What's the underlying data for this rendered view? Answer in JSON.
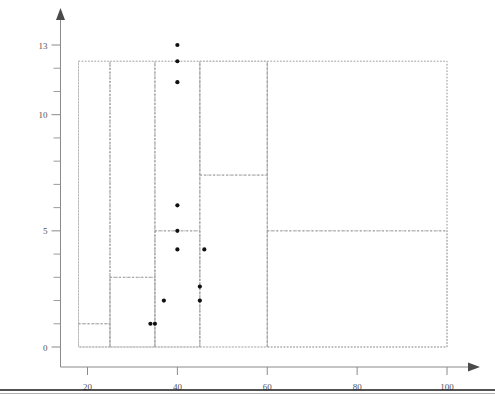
{
  "chart_data": {
    "type": "scatter",
    "title": "",
    "subtitle": "",
    "xlabel": "",
    "ylabel": "",
    "xlim": [
      14,
      104
    ],
    "ylim": [
      0,
      13.6
    ],
    "xticks": [
      20,
      40,
      60,
      80,
      100
    ],
    "xtick_labels": [
      "20",
      "40",
      "60",
      "80",
      "100"
    ],
    "yticks": [
      0,
      5,
      10,
      13
    ],
    "ytick_labels": [
      "0",
      "5",
      "10",
      "13"
    ],
    "y_minor_ticks": [
      1,
      2,
      3,
      4,
      6,
      7,
      8,
      9,
      11,
      12
    ],
    "grid": false,
    "legend": null,
    "legend_position": "none",
    "point_color": "#111111",
    "partition_color": "#b9b9b9",
    "axis_color": "#8a8a8a",
    "points": [
      {
        "x": 40,
        "y": 13
      },
      {
        "x": 40,
        "y": 12.3
      },
      {
        "x": 40,
        "y": 11.4
      },
      {
        "x": 40,
        "y": 6.1
      },
      {
        "x": 40,
        "y": 5
      },
      {
        "x": 40,
        "y": 4.2
      },
      {
        "x": 46,
        "y": 4.2
      },
      {
        "x": 45,
        "y": 2.6
      },
      {
        "x": 45,
        "y": 2
      },
      {
        "x": 37,
        "y": 2
      },
      {
        "x": 35,
        "y": 1
      },
      {
        "x": 34,
        "y": 1
      }
    ],
    "partitions": [
      {
        "name": "root",
        "x0": 18,
        "x1": 100,
        "y0": 0,
        "y1": 12.3
      },
      {
        "name": "left-block",
        "x0": 18,
        "x1": 25,
        "y0": 0,
        "y1": 12.3
      },
      {
        "name": "left-lower",
        "x0": 18,
        "x1": 25,
        "y0": 0,
        "y1": 1
      },
      {
        "name": "mid-left-block",
        "x0": 25,
        "x1": 35,
        "y0": 0,
        "y1": 12.3
      },
      {
        "name": "mid-left-lower",
        "x0": 25,
        "x1": 35,
        "y0": 0,
        "y1": 3
      },
      {
        "name": "center-block",
        "x0": 35,
        "x1": 45,
        "y0": 0,
        "y1": 12.3
      },
      {
        "name": "center-lower",
        "x0": 35,
        "x1": 45,
        "y0": 0,
        "y1": 5
      },
      {
        "name": "right-mid-block",
        "x0": 45,
        "x1": 60,
        "y0": 0,
        "y1": 12.3
      },
      {
        "name": "right-mid-upper",
        "x0": 45,
        "x1": 60,
        "y0": 7.4,
        "y1": 12.3
      },
      {
        "name": "right-block",
        "x0": 60,
        "x1": 100,
        "y0": 0,
        "y1": 12.3
      },
      {
        "name": "right-lower",
        "x0": 60,
        "x1": 100,
        "y0": 0,
        "y1": 5
      }
    ],
    "split_lines": [
      {
        "name": "v-split-25",
        "orientation": "vertical",
        "at": 25,
        "from": 0,
        "to": 12.3
      },
      {
        "name": "v-split-35",
        "orientation": "vertical",
        "at": 35,
        "from": 0,
        "to": 12.3
      },
      {
        "name": "v-split-45",
        "orientation": "vertical",
        "at": 45,
        "from": 0,
        "to": 12.3
      },
      {
        "name": "v-split-60",
        "orientation": "vertical",
        "at": 60,
        "from": 0,
        "to": 12.3
      },
      {
        "name": "h-split-1",
        "orientation": "horizontal",
        "at": 1,
        "from": 18,
        "to": 25
      },
      {
        "name": "h-split-3",
        "orientation": "horizontal",
        "at": 3,
        "from": 25,
        "to": 35
      },
      {
        "name": "h-split-5-center",
        "orientation": "horizontal",
        "at": 5,
        "from": 35,
        "to": 45
      },
      {
        "name": "h-split-7p4",
        "orientation": "horizontal",
        "at": 7.4,
        "from": 45,
        "to": 60
      },
      {
        "name": "h-split-5-right",
        "orientation": "horizontal",
        "at": 5,
        "from": 60,
        "to": 100
      }
    ]
  },
  "figure": {
    "footer_rule_visible": true
  }
}
